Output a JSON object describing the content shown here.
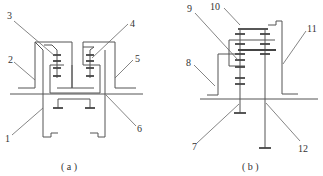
{
  "figure": {
    "panel_a": {
      "caption": "( a )",
      "labels": [
        {
          "id": "1",
          "text": "1"
        },
        {
          "id": "2",
          "text": "2"
        },
        {
          "id": "3",
          "text": "3"
        },
        {
          "id": "4",
          "text": "4"
        },
        {
          "id": "5",
          "text": "5"
        },
        {
          "id": "6",
          "text": "6"
        }
      ]
    },
    "panel_b": {
      "caption": "( b )",
      "labels": [
        {
          "id": "7",
          "text": "7"
        },
        {
          "id": "8",
          "text": "8"
        },
        {
          "id": "9",
          "text": "9"
        },
        {
          "id": "10",
          "text": "10"
        },
        {
          "id": "11",
          "text": "11"
        },
        {
          "id": "12",
          "text": "12"
        }
      ]
    },
    "colors": {
      "line": "#555555",
      "text": "#333333",
      "background": "#ffffff"
    }
  }
}
